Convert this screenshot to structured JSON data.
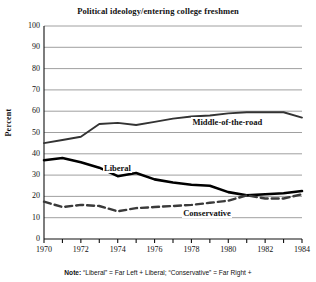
{
  "chart_data": {
    "type": "line",
    "title": "Political ideology/entering college freshmen",
    "xlabel": "",
    "ylabel": "Percent",
    "ylim": [
      0,
      100
    ],
    "xlim": [
      1970,
      1984
    ],
    "ytick_step": 10,
    "grid": true,
    "legend_position": "inline-annotations",
    "x": [
      1970,
      1971,
      1972,
      1973,
      1974,
      1975,
      1976,
      1977,
      1978,
      1979,
      1980,
      1981,
      1982,
      1983,
      1984
    ],
    "xticks": [
      1970,
      1971,
      1972,
      1973,
      1974,
      1975,
      1976,
      1977,
      1978,
      1979,
      1980,
      1981,
      1982,
      1983,
      1984
    ],
    "xtick_labels": [
      "1970",
      "",
      "1972",
      "",
      "1974",
      "",
      "1976",
      "",
      "1978",
      "",
      "1980",
      "",
      "1982",
      "",
      "1984"
    ],
    "yticks": [
      0,
      10,
      20,
      30,
      40,
      50,
      60,
      70,
      80,
      90,
      100
    ],
    "ytick_labels": [
      "0",
      "10",
      "20",
      "30",
      "40",
      "50",
      "60",
      "70",
      "80",
      "90",
      "100"
    ],
    "series": [
      {
        "name": "Middle-of-the-road",
        "style": "solid",
        "width": 1.9,
        "color": "#333333",
        "label_x": 1978.0,
        "label_y": 55.0,
        "values": [
          45,
          46.5,
          48,
          54,
          54.5,
          53.5,
          55,
          56.5,
          57.5,
          58,
          59,
          59.5,
          59.5,
          59.5,
          57
        ]
      },
      {
        "name": "Liberal",
        "style": "solid",
        "width": 2.6,
        "color": "#000000",
        "label_x": 1973.2,
        "label_y": 33.5,
        "values": [
          37,
          38,
          36,
          33.5,
          29.5,
          31,
          28,
          26.5,
          25.5,
          25,
          22,
          20.5,
          21,
          21.5,
          22.5
        ]
      },
      {
        "name": "Conservative",
        "style": "dashed",
        "width": 2.4,
        "color": "#3a3a3a",
        "label_x": 1977.5,
        "label_y": 12.2,
        "values": [
          17.5,
          15,
          16,
          15.5,
          13,
          14.5,
          15,
          15.5,
          16,
          17,
          18,
          20.5,
          19,
          19,
          21
        ]
      }
    ]
  },
  "note": {
    "prefix": "Note:",
    "text": "“Liberal” = Far Left + Liberal; “Conservative” = Far Right +"
  },
  "colors": {
    "grid": "#888888",
    "axis": "#111111",
    "background": "#ffffff"
  }
}
